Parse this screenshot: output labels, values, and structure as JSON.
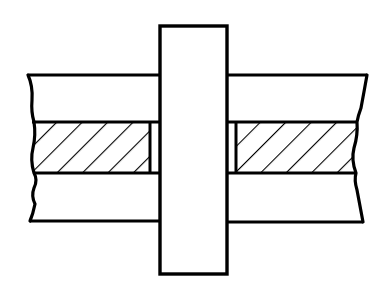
{
  "diagram": {
    "title": "Cross-section: pin through layered plate assembly",
    "colors": {
      "stroke": "#000000",
      "background": "#ffffff",
      "hatch": "#000000"
    },
    "components": [
      {
        "id": "pin",
        "label": "Vertical pin / shaft"
      },
      {
        "id": "upper-plate",
        "label": "Upper plate"
      },
      {
        "id": "hatched-layer",
        "label": "Sectioned middle layer (hatched)"
      },
      {
        "id": "lower-plate",
        "label": "Lower plate"
      },
      {
        "id": "left-clearance-gap",
        "label": "Left bore clearance"
      },
      {
        "id": "right-clearance-gap",
        "label": "Right bore clearance"
      }
    ]
  }
}
